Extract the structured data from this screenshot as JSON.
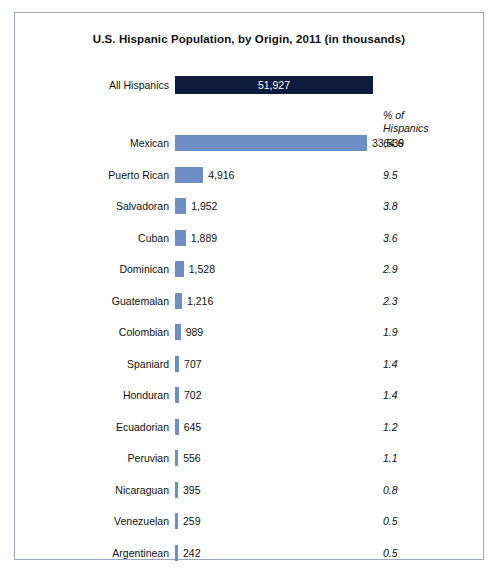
{
  "chart_data": {
    "type": "bar",
    "title": "U.S. Hispanic Population, by Origin, 2011 (in thousands)",
    "xlabel": "",
    "ylabel": "",
    "orientation": "horizontal",
    "grid": false,
    "legend": null,
    "pct_header_line1": "% of",
    "pct_header_line2": "Hispanics",
    "total": {
      "category": "All Hispanics",
      "value": 51927,
      "value_label": "51,927"
    },
    "categories": [
      "Mexican",
      "Puerto Rican",
      "Salvadoran",
      "Cuban",
      "Dominican",
      "Guatemalan",
      "Colombian",
      "Spaniard",
      "Honduran",
      "Ecuadorian",
      "Peruvian",
      "Nicaraguan",
      "Venezuelan",
      "Argentinean"
    ],
    "values": [
      33539,
      4916,
      1952,
      1889,
      1528,
      1216,
      989,
      707,
      702,
      645,
      556,
      395,
      259,
      242
    ],
    "value_labels": [
      "33,539",
      "4,916",
      "1,952",
      "1,889",
      "1,528",
      "1,216",
      "989",
      "707",
      "702",
      "645",
      "556",
      "395",
      "259",
      "242"
    ],
    "percents": [
      64.6,
      9.5,
      3.8,
      3.6,
      2.9,
      2.3,
      1.9,
      1.4,
      1.4,
      1.2,
      1.1,
      0.8,
      0.5,
      0.5
    ],
    "percent_labels": [
      "64.6",
      "9.5",
      "3.8",
      "3.6",
      "2.9",
      "2.3",
      "1.9",
      "1.4",
      "1.4",
      "1.2",
      "1.1",
      "0.8",
      "0.5",
      "0.5"
    ],
    "colors": {
      "bar": "#6e8fc4",
      "total_bar": "#0f1b3d",
      "frame": "#9aa7c0",
      "text": "#111111"
    }
  }
}
